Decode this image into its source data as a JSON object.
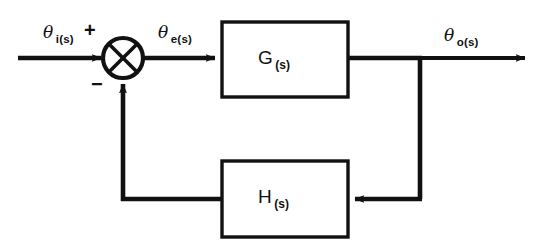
{
  "diagram": {
    "stroke_color": "#111111",
    "background_color": "#ffffff",
    "fill_color": "#ffffff",
    "signals": {
      "input": {
        "symbol": "θ",
        "subscript": "i(s)"
      },
      "error": {
        "symbol": "θ",
        "subscript": "e(s)"
      },
      "output": {
        "symbol": "θ",
        "subscript": "o(s)"
      }
    },
    "summing_junction": {
      "name": "summing-junction",
      "shape": "circle-with-cross",
      "input_sign": "+",
      "feedback_sign": "−"
    },
    "blocks": [
      {
        "id": "forward",
        "symbol": "G",
        "subscript": "(s)"
      },
      {
        "id": "feedback",
        "symbol": "H",
        "subscript": "(s)"
      }
    ]
  }
}
